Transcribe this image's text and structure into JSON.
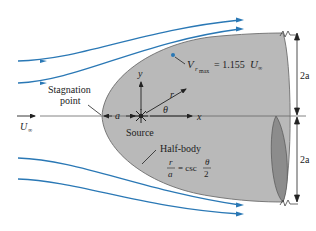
{
  "figure": {
    "colors": {
      "streamline": "#2a78b5",
      "body_fill": "#b9b9b9",
      "body_edge": "#6e6e6e",
      "cap_fill": "#8c8c8c",
      "text": "#222222",
      "axis": "#555555"
    }
  },
  "labels": {
    "vmax_V": "V",
    "vmax_sub": "r",
    "vmax_subsub": "max",
    "vmax_eq": "= 1.155",
    "vmax_U": "U",
    "vmax_Usub": "∞",
    "stagnation_line1": "Stagnation",
    "stagnation_line2": "point",
    "freestream_U": "U",
    "freestream_sub": "∞",
    "a_label": "a",
    "source": "Source",
    "y_axis": "y",
    "x_axis": "x",
    "r_label": "r",
    "theta": "θ",
    "half_body": "Half-body",
    "eq_r": "r",
    "eq_a": "a",
    "eq_csc": "= csc",
    "eq_theta": "θ",
    "eq_two": "2",
    "dim_upper": "2a",
    "dim_lower": "2a"
  }
}
